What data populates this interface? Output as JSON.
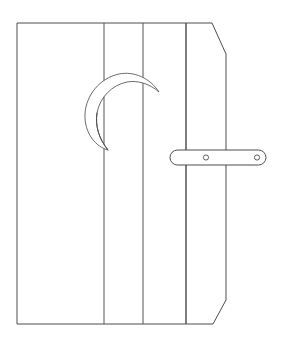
{
  "drawing": {
    "title": "Outhouse Door",
    "subject": "outhouse-door-with-crescent-moon",
    "style": "black-and-white line drawing",
    "background_color": "#ffffff",
    "stroke_color": "#4d4d4d",
    "canvas": {
      "width": 283,
      "height": 346
    },
    "door": {
      "name": "door-panel",
      "outline_points": "17,23 212,23 226,54 226,300 213,324 17,324",
      "left_edge_x": 17,
      "right_edge_x": 226,
      "top_edge_y": 23,
      "bottom_edge_y": 324,
      "top_bevel": {
        "from_x": 212,
        "from_y": 23,
        "to_x": 226,
        "to_y": 54
      },
      "bottom_bevel": {
        "from_x": 226,
        "from_y": 300,
        "to_x": 213,
        "to_y": 324
      },
      "fill_color": "#ffffff"
    },
    "planks": {
      "name": "vertical-plank-seams",
      "count": 4,
      "seam_x_positions": [
        62,
        104,
        143,
        186
      ],
      "seam_top_y": 23,
      "seam_bottom_y": 324,
      "stroke_color": "#555555"
    },
    "moon": {
      "name": "crescent-moon-cutout",
      "description": "crescent moon opening toward the right",
      "center_x": 124,
      "center_y": 110,
      "outer_radius": 36,
      "inner_radius": 30,
      "outer_path": "M 159,92 A 38,40 0 1 0 108,150",
      "inner_path": "M 108,150 A 34,36 0 1 1 159,92",
      "stroke_color": "#5a5a5a",
      "fill_color": "#ffffff",
      "upper_tip": {
        "x": 159,
        "y": 92
      },
      "lower_tip": {
        "x": 108,
        "y": 150
      }
    },
    "latch": {
      "name": "door-latch-handle",
      "description": "horizontal stadium-shaped latch bar with two screw holes",
      "x": 170,
      "y": 150,
      "width": 96,
      "height": 15,
      "corner_radius": 7.5,
      "stroke_color": "#4d4d4d",
      "fill_color": "#ffffff",
      "screws": [
        {
          "name": "screw-hole-left",
          "cx": 206,
          "cy": 157.5,
          "r": 2.6
        },
        {
          "name": "screw-hole-right",
          "cx": 257,
          "cy": 157.5,
          "r": 2.6
        }
      ]
    }
  }
}
